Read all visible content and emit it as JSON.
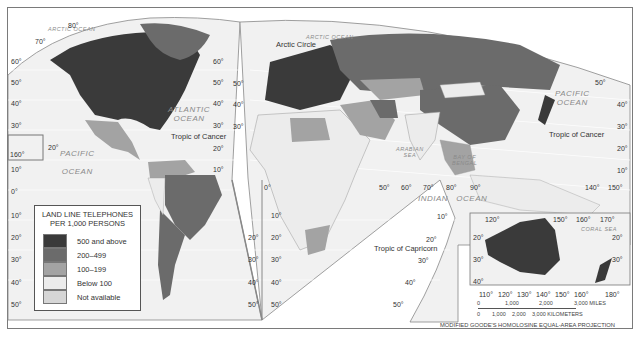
{
  "map": {
    "title": "Land Line Telephones per 1,000 Persons",
    "projection": "MODIFIED GOODE'S HOMOLOSINE EQUAL-AREA PROJECTION",
    "legend": {
      "title_line1": "LAND LINE TELEPHONES",
      "title_line2": "PER 1,000 PERSONS",
      "items": [
        {
          "label": "500 and above",
          "color": "#3a3a3a"
        },
        {
          "label": "200–499",
          "color": "#6b6b6b"
        },
        {
          "label": "100–199",
          "color": "#a3a3a3"
        },
        {
          "label": "Below 100",
          "color": "#ececec"
        },
        {
          "label": "Not available",
          "color": "#d6d6d6"
        }
      ]
    },
    "oceans": {
      "arctic_west": "ARCTIC OCEAN",
      "arctic_east": "ARCTIC OCEAN",
      "atlantic_1": "ATLANTIC",
      "atlantic_2": "OCEAN",
      "pacific_w1": "PACIFIC",
      "pacific_w2": "OCEAN",
      "pacific_e1": "PACIFIC",
      "pacific_e2": "OCEAN",
      "indian_1": "INDIAN",
      "indian_2": "OCEAN",
      "arabian_1": "ARABIAN",
      "arabian_2": "SEA",
      "bengal_1": "BAY OF",
      "bengal_2": "BENGAL",
      "coral": "CORAL SEA"
    },
    "lines": {
      "arctic_circle": "Arctic Circle",
      "tropic_cancer_w": "Tropic of Cancer",
      "tropic_cancer_e": "Tropic of Cancer",
      "tropic_capricorn": "Tropic of Capricorn"
    },
    "lat_labels_left": [
      "60°",
      "50°",
      "40°",
      "30°",
      "20°",
      "10°",
      "0°",
      "10°",
      "20°",
      "30°",
      "40°",
      "50°"
    ],
    "lat_labels_na_right": [
      "60°",
      "50°",
      "40°",
      "30°",
      "20°",
      "10°"
    ],
    "lat_labels_sa_right": [
      "20°",
      "30°",
      "40°",
      "50°"
    ],
    "lat_labels_af_left": [
      "10°",
      "20°",
      "30°",
      "40°",
      "50°"
    ],
    "lat_labels_eu": [
      "50°",
      "40°",
      "30°"
    ],
    "lat_labels_right": [
      "40°",
      "30°",
      "20°",
      "10°"
    ],
    "lat_labels_io": [
      "10°",
      "20°",
      "30°",
      "40°",
      "50°"
    ],
    "top_labels": {
      "eighty": "80°",
      "seventy": "70°",
      "fifty_e": "50°",
      "twenty_pac": "20°",
      "onesixty": "160°"
    },
    "lon_labels_io": [
      "0°",
      "50°",
      "60°",
      "70°",
      "80°",
      "90°"
    ],
    "lon_labels_pac": [
      "140°",
      "150°"
    ],
    "australia_inset": {
      "lon_top": [
        "120°",
        "150°",
        "160°",
        "170°"
      ],
      "lon_bottom": [
        "110°",
        "120°",
        "130°",
        "140°",
        "150°",
        "160°",
        "180°"
      ],
      "lat_left": [
        "20°",
        "30°",
        "40°"
      ],
      "lat_right": [
        "20°",
        "30°"
      ]
    },
    "scale": {
      "miles_ticks": [
        "0",
        "1,000",
        "2,000",
        "3,000 MILES"
      ],
      "km_ticks": [
        "0",
        "1,000",
        "2,000",
        "3,000 KILOMETERS"
      ]
    }
  }
}
